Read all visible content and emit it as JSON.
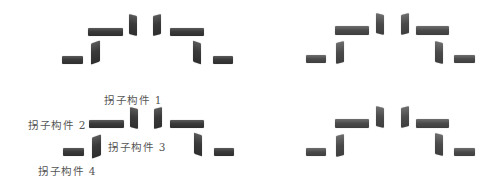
{
  "figure": {
    "colors": {
      "block": "#3a3a3a",
      "label": "#555555",
      "background": "#ffffff"
    }
  },
  "annotations": {
    "label_1": "拐子构件 1",
    "label_2": "拐子构件 2",
    "label_3": "拐子构件 3",
    "label_4": "拐子构件 4"
  },
  "quadrants": [
    {
      "name": "top-left",
      "annotated": false
    },
    {
      "name": "top-right",
      "annotated": false
    },
    {
      "name": "bottom-left",
      "annotated": true
    },
    {
      "name": "bottom-right",
      "annotated": false
    }
  ]
}
